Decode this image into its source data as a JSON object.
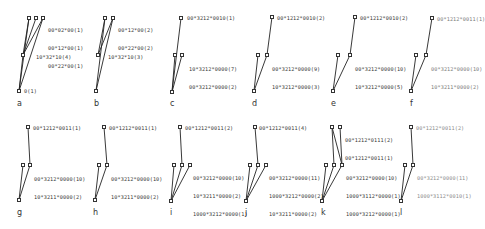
{
  "panels": [
    {
      "letter": "a",
      "top_labels": [
        "00*02*00(1)",
        "00*12*00(1)",
        "00*22*00(1)"
      ],
      "mid_labels": [
        "10*32*10(4)"
      ],
      "root_label": "0(1)"
    },
    {
      "letter": "b",
      "top_labels": [
        "00*12*00(2)",
        "00*22*00(2)"
      ],
      "mid_labels": [
        "10*32*10(3)"
      ]
    },
    {
      "letter": "c",
      "top_labels": [
        "00*3212*0010(1)"
      ],
      "mid_labels": [
        "10*3212*0000(7)",
        "00*3212*0000(2)"
      ]
    },
    {
      "letter": "d",
      "top_labels": [
        "00*1212*0010(2)"
      ],
      "mid_labels": [
        "00*3212*0000(9)",
        "10*3212*0000(3)"
      ]
    },
    {
      "letter": "e",
      "top_labels": [
        "00*1212*0010(2)"
      ],
      "mid_labels": [
        "00*3212*0000(10)",
        "10*3212*0000(5)"
      ]
    },
    {
      "letter": "f",
      "top_labels": [
        "00*1212*0011(1)"
      ],
      "mid_labels": [
        "00*3212*0000(10)",
        "10*3211*0000(2)"
      ]
    },
    {
      "letter": "g",
      "top_labels": [
        "00*1212*0011(1)"
      ],
      "mid_labels": [
        "00*3212*0000(10)",
        "10*3211*0000(2)"
      ]
    },
    {
      "letter": "h",
      "top_labels": [
        "00*1212*0011(1)"
      ],
      "mid_labels": [
        "00*3212*0000(10)",
        "10*3211*0000(2)"
      ]
    },
    {
      "letter": "i",
      "top_labels": [
        "00*1212*0011(2)"
      ],
      "mid_labels": [
        "00*3212*0000(10)",
        "10*3211*0000(2)",
        "1000*3212*0000(1)"
      ]
    },
    {
      "letter": "j",
      "top_labels": [
        "00*1212*0011(4)"
      ],
      "mid_labels": [
        "00*3212*0000(11)",
        "1000*3212*0000(2)",
        "10*3211*0000(2)"
      ]
    },
    {
      "letter": "k",
      "top_labels": [
        "00*1212*0111(2)",
        "00*1212*0011(1)"
      ],
      "mid_labels": [
        "00*3212*0000(10)",
        "1000*3112*0000(1)",
        "1000*3212*0000(1)"
      ]
    },
    {
      "letter": "l",
      "top_labels": [
        "00*1212*0011(2)"
      ],
      "mid_labels": [
        "00*3212*0000(11)",
        "1000*3112*0010(1)"
      ]
    }
  ]
}
